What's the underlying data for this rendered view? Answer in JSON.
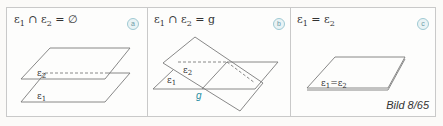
{
  "figure": {
    "caption": "Bild 8/65",
    "colors": {
      "line": "#7a7a7a",
      "accent": "#2a8fa3",
      "border": "#c9c9c9",
      "badge": "#9fc9d3"
    },
    "panels": [
      {
        "id": "a",
        "badge": "a",
        "formula": "ε1 ∩ ε2 = ∅",
        "formula_parts": {
          "e1": "ε",
          "s1": "1",
          "op": " ∩ ",
          "e2": "ε",
          "s2": "2",
          "rhs": " = ∅"
        },
        "description": "parallel planes, no intersection",
        "plane_labels": {
          "upper": "ε2",
          "lower": "ε1"
        }
      },
      {
        "id": "b",
        "badge": "b",
        "formula": "ε1 ∩ ε2 = g",
        "formula_parts": {
          "e1": "ε",
          "s1": "1",
          "op": " ∩ ",
          "e2": "ε",
          "s2": "2",
          "rhs": " = g"
        },
        "description": "planes intersect in line g",
        "plane_labels": {
          "tilted": "ε2",
          "horizontal": "ε1",
          "line": "g"
        }
      },
      {
        "id": "c",
        "badge": "c",
        "formula": "ε1 = ε2",
        "formula_parts": {
          "e1": "ε",
          "s1": "1",
          "op": " = ",
          "e2": "ε",
          "s2": "2",
          "rhs": ""
        },
        "description": "identical planes",
        "plane_labels": {
          "combined": "ε1 = ε2"
        }
      }
    ]
  }
}
